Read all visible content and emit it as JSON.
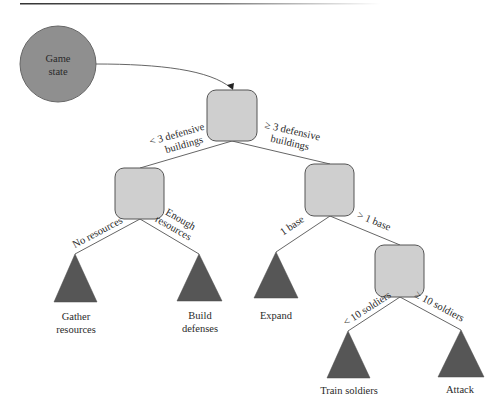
{
  "diagram": {
    "type": "decision-tree",
    "colors": {
      "state_fill": "#8f8f8f",
      "decision_fill": "#cfcfcf",
      "leaf_fill": "#565656",
      "edge": "#666666"
    },
    "start": {
      "line1": "Game",
      "line2": "state"
    },
    "edges": {
      "root_left": "< 3 defensive",
      "root_left_2": "buildings",
      "root_right": "≥ 3 defensive",
      "root_right_2": "buildings",
      "left_left": "No resources",
      "left_right": "Enough",
      "left_right_2": "resources",
      "right_left": "1 base",
      "right_right": "> 1 base",
      "bottom_left": "< 10 soldiers",
      "bottom_right": "≥ 10 soldiers"
    },
    "leaves": {
      "gather_1": "Gather",
      "gather_2": "resources",
      "build_1": "Build",
      "build_2": "defenses",
      "expand": "Expand",
      "train": "Train soldiers",
      "attack": "Attack"
    }
  }
}
